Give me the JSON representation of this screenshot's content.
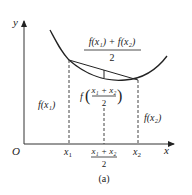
{
  "diagram": {
    "type": "convex-function-jensen",
    "caption": "(a)",
    "axes": {
      "y_label": "y",
      "x_label": "x",
      "origin_label": "O"
    },
    "x_ticks": {
      "x1": "x",
      "x1_sub": "1",
      "x2": "x",
      "x2_sub": "2",
      "mid_num": "x₁ + x₂",
      "mid_den": "2"
    },
    "labels": {
      "f_x1": "f(x₁)",
      "f_x2": "f(x₂)",
      "chord_mid_num": "f(x₁) + f(x₂)",
      "chord_mid_den": "2",
      "f_mid_prefix": "f",
      "f_mid_num": "x₁ + x₂",
      "f_mid_den": "2"
    },
    "colors": {
      "stroke": "#222222",
      "axis": "#333333",
      "dashed": "#444444"
    }
  }
}
